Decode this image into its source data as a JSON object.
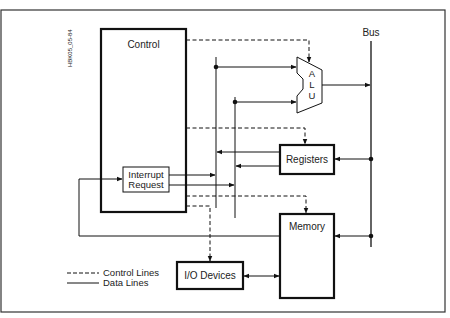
{
  "figure": {
    "id_label": "HBK05_05-84",
    "frame_color": "#333333",
    "line_color": "#111111"
  },
  "blocks": {
    "control": {
      "label": "Control"
    },
    "interrupt_request": {
      "line1": "Interrupt",
      "line2": "Request"
    },
    "alu": {
      "letters": [
        "A",
        "L",
        "U"
      ]
    },
    "registers": {
      "label": "Registers"
    },
    "memory": {
      "label": "Memory"
    },
    "io_devices": {
      "label": "I/O Devices"
    },
    "bus": {
      "label": "Bus"
    }
  },
  "legend": {
    "control_lines": "Control Lines",
    "data_lines": "Data Lines"
  }
}
